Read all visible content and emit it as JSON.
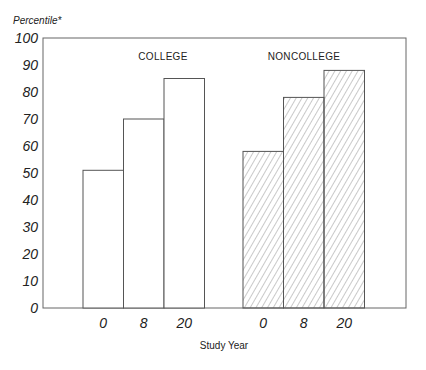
{
  "chart_data": {
    "type": "bar",
    "title": "",
    "ylabel": "Percentile*",
    "xlabel": "Study Year",
    "ylim": [
      0,
      100
    ],
    "yticks": [
      "0",
      "10",
      "20",
      "30",
      "40",
      "50",
      "60",
      "70",
      "80",
      "90",
      "100"
    ],
    "grid": false,
    "groups": [
      {
        "name": "COLLEGE",
        "fill": "none",
        "categories": [
          "0",
          "8",
          "20"
        ],
        "values": [
          51,
          70,
          85
        ]
      },
      {
        "name": "NONCOLLEGE",
        "fill": "hatched",
        "categories": [
          "0",
          "8",
          "20"
        ],
        "values": [
          58,
          78,
          88
        ]
      }
    ],
    "colors": {
      "stroke": "#555555",
      "hatch": "#777777",
      "background": "#ffffff"
    }
  }
}
